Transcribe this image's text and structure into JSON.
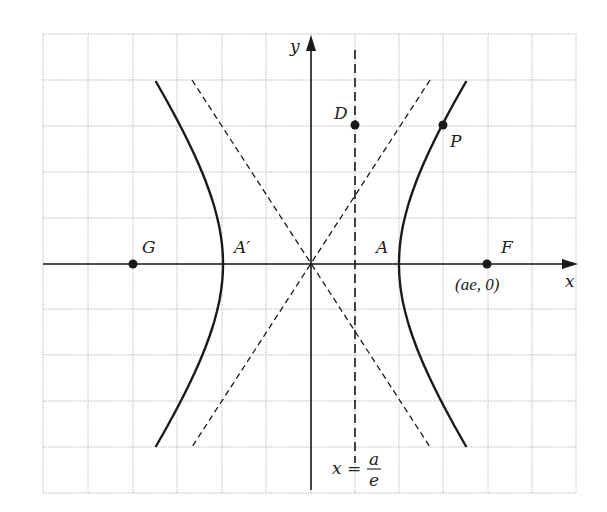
{
  "figure": {
    "colors": {
      "grid": "#b8b8b8",
      "curve": "#1a1a1a",
      "axis": "#1a1a1a",
      "background": "#ffffff"
    },
    "grid": {
      "left": 43,
      "top": 34,
      "right": 576,
      "bottom": 493,
      "vlines": [
        43,
        88,
        133,
        177,
        222,
        266,
        311,
        355,
        399,
        443,
        488,
        532,
        576
      ],
      "hlines": [
        34,
        80,
        126,
        172,
        218,
        264,
        309,
        355,
        401,
        447,
        493
      ]
    },
    "axes": {
      "x_label": "x",
      "y_label": "y"
    },
    "points": {
      "G": {
        "label": "G"
      },
      "A_prime": {
        "label": "A′"
      },
      "A": {
        "label": "A"
      },
      "F": {
        "label": "F",
        "coord_label": "(ae, 0)"
      },
      "D": {
        "label": "D"
      },
      "P": {
        "label": "P"
      }
    },
    "directrix": {
      "label_lhs": "x =",
      "label_num": "a",
      "label_den": "e"
    }
  },
  "chart_data": {
    "type": "diagram",
    "curves": [
      {
        "name": "right branch",
        "style": "solid",
        "vertex": "A"
      },
      {
        "name": "left branch",
        "style": "solid",
        "vertex": "A′"
      },
      {
        "name": "asymptote y = (b/a)x",
        "style": "dashed"
      },
      {
        "name": "asymptote y = −(b/a)x",
        "style": "dashed"
      },
      {
        "name": "directrix x = a/e",
        "style": "long-dashed"
      }
    ],
    "labeled_points": [
      "G",
      "A′",
      "A",
      "F",
      "D",
      "P"
    ],
    "annotations": [
      "(ae, 0)",
      "x = a/e"
    ],
    "xlabel": "x",
    "ylabel": "y",
    "grid": true
  }
}
